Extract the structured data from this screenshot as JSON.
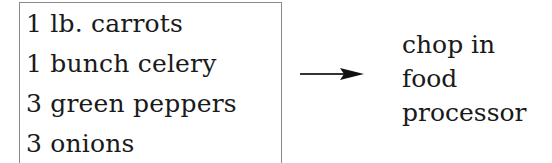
{
  "ingredients": [
    "1 lb. carrots",
    "1 bunch celery",
    "3 green peppers",
    "3 onions"
  ],
  "arrow": {
    "icon": "right-arrow-icon",
    "color": "#1a1a1a"
  },
  "instruction": {
    "lines": [
      "chop in",
      "food",
      "processor"
    ]
  }
}
